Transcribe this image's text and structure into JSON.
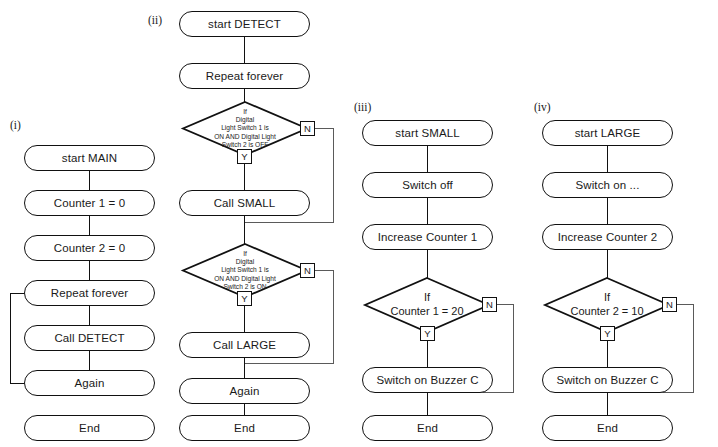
{
  "diagram": {
    "line_color": "#111111",
    "fill_color": "#ffffff",
    "text_color": "#1a1a1a"
  },
  "columns": [
    {
      "caption": "(i)",
      "name": "MAIN",
      "nodes": [
        {
          "label": "start MAIN"
        },
        {
          "label": "Counter 1 = 0"
        },
        {
          "label": "Counter 2 = 0"
        },
        {
          "label": "Repeat forever"
        },
        {
          "label": "Call DETECT"
        },
        {
          "label": "Again"
        },
        {
          "label": "End"
        }
      ]
    },
    {
      "caption": "(ii)",
      "name": "DETECT",
      "nodes": [
        {
          "label": "start DETECT"
        },
        {
          "label": "Repeat forever"
        },
        {
          "label": "Call SMALL"
        },
        {
          "label": "Call LARGE"
        },
        {
          "label": "Again"
        },
        {
          "label": "End"
        }
      ],
      "decisions": [
        {
          "lines": [
            "If",
            "Digital",
            "Light Switch 1 is",
            "ON AND Digital Light",
            "Switch 2 is OFF"
          ],
          "yes_label": "Y",
          "no_label": "N"
        },
        {
          "lines": [
            "If",
            "Digital",
            "Light Switch 1 is",
            "ON AND Digital Light",
            "Switch 2 is ON"
          ],
          "yes_label": "Y",
          "no_label": "N"
        }
      ]
    },
    {
      "caption": "(iii)",
      "name": "SMALL",
      "nodes": [
        {
          "label": "start SMALL"
        },
        {
          "label": "Switch off"
        },
        {
          "label": "Increase Counter 1"
        },
        {
          "label": "Switch on Buzzer C"
        },
        {
          "label": "End"
        }
      ],
      "decisions": [
        {
          "lines": [
            "If",
            "Counter 1 = 20"
          ],
          "yes_label": "Y",
          "no_label": "N"
        }
      ]
    },
    {
      "caption": "(iv)",
      "name": "LARGE",
      "nodes": [
        {
          "label": "start LARGE"
        },
        {
          "label": "Switch on ..."
        },
        {
          "label": "Increase Counter 2"
        },
        {
          "label": "Switch on Buzzer C"
        },
        {
          "label": "End"
        }
      ],
      "decisions": [
        {
          "lines": [
            "If",
            "Counter 2 = 10"
          ],
          "yes_label": "Y",
          "no_label": "N"
        }
      ]
    }
  ]
}
